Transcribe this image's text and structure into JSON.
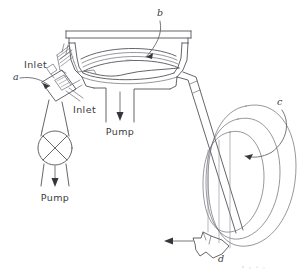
{
  "figure": {
    "kind": "technical-line-drawing",
    "background_color": "#ffffff",
    "line_color": "#4a4a50",
    "width": 305,
    "height": 274
  },
  "labels": {
    "a": "a",
    "b": "b",
    "c": "c",
    "d": "d"
  },
  "callouts": [
    {
      "key": "a",
      "text": "a",
      "target": "inlet-valve-block"
    },
    {
      "key": "b",
      "text": "b",
      "target": "chamber-lens-element"
    },
    {
      "key": "c",
      "text": "c",
      "target": "toroidal-coil"
    },
    {
      "key": "d",
      "text": "d",
      "target": "outlet-nozzle"
    }
  ],
  "annotations": {
    "inlet_upper": "Inlet",
    "inlet_lower": "Inlet",
    "pump_center": "Pump",
    "pump_left": "Pump"
  },
  "flow_arrows": [
    {
      "name": "pump-arrow-center",
      "direction": "down",
      "label": "Pump"
    },
    {
      "name": "pump-arrow-left",
      "direction": "down",
      "label": "Pump"
    },
    {
      "name": "outlet-arrow",
      "direction": "left",
      "label": "d"
    }
  ]
}
